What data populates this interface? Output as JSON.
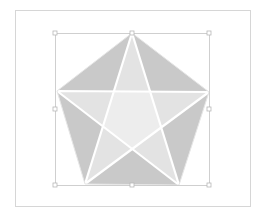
{
  "diagram": {
    "colors": {
      "background": "#ffffff",
      "frame": "#d6d6d6",
      "selection": "#c4c4c4",
      "outer_triangles": "#c9c9c9",
      "star_tips": "#e3e3e3",
      "inner_pentagon": "#ededed",
      "lines": "#ffffff",
      "handle_fill": "#ffffff",
      "handle_stroke": "#b8b8b8"
    },
    "frame": {
      "x": 15,
      "y": 10,
      "width": 235,
      "height": 196
    },
    "selection_box": {
      "x": 55,
      "y": 33,
      "width": 154,
      "height": 152
    },
    "pentagon_vertices": [
      [
        132,
        33
      ],
      [
        209,
        92
      ],
      [
        179,
        185
      ],
      [
        85,
        184
      ],
      [
        57,
        91
      ]
    ],
    "handles": [
      {
        "name": "top-left",
        "x": 55,
        "y": 33
      },
      {
        "name": "top-center",
        "x": 132,
        "y": 33
      },
      {
        "name": "top-right",
        "x": 209,
        "y": 33
      },
      {
        "name": "middle-left",
        "x": 55,
        "y": 109
      },
      {
        "name": "middle-right",
        "x": 209,
        "y": 109
      },
      {
        "name": "bottom-left",
        "x": 55,
        "y": 185
      },
      {
        "name": "bottom-center",
        "x": 132,
        "y": 185
      },
      {
        "name": "bottom-right",
        "x": 209,
        "y": 185
      }
    ]
  }
}
